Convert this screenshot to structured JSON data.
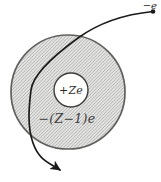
{
  "diagram": {
    "incident_electron_label": "−e",
    "nucleus_label": "+Ze",
    "electron_cloud_label": "−(Z−1)e"
  },
  "colors": {
    "background": "#ffffff",
    "cloud_fill": "#e5e5e3",
    "hatch_line": "#8d8d8b",
    "cloud_outline": "#606060",
    "nucleus_fill": "#fdfdfc",
    "nucleus_outline": "#3c3c3c",
    "trajectory": "#1b1b1b",
    "electron_label_text": "#1f1f1f",
    "nucleus_label_text": "#2f2f2f",
    "cloud_label_text": "#3d3d3d"
  }
}
